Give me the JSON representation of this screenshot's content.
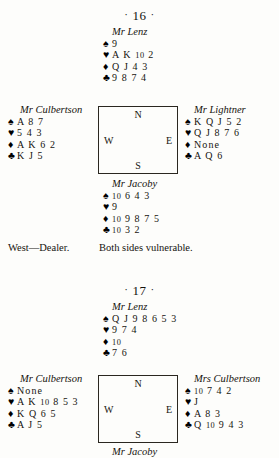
{
  "page": {
    "background": "#fdfdfb",
    "ink": "#16140f"
  },
  "suits": {
    "spade": "♠",
    "heart": "♥",
    "diamond": "♦",
    "club": "♣"
  },
  "compass": {
    "north": "N",
    "south": "S",
    "west": "W",
    "east": "E"
  },
  "deals": [
    {
      "number_label": "16",
      "dot_left": "·",
      "dot_right": "·",
      "north": {
        "player": "Mr Lenz",
        "spades": "9",
        "hearts": "A K 10 2",
        "diamonds": "Q J 4 3",
        "clubs": "9 8 7 4"
      },
      "west": {
        "player": "Mr Culbertson",
        "spades": "A 8 7",
        "hearts": "5 4 3",
        "diamonds": "A K 6 2",
        "clubs": "K J 5"
      },
      "east": {
        "player": "Mr Lightner",
        "spades": "K Q J 5 2",
        "hearts": "Q J 8 7 6",
        "diamonds": "None",
        "clubs": "A Q 6"
      },
      "south": {
        "player": "Mr Jacoby",
        "spades": "10 6 4 3",
        "hearts": "9",
        "diamonds": "10 9 8 7 5",
        "clubs": "10 3 2"
      },
      "dealer": "West—Dealer.",
      "vulnerability": "Both sides vulnerable."
    },
    {
      "number_label": "17",
      "dot_left": "·",
      "dot_right": "·",
      "north": {
        "player": "Mr Lenz",
        "spades": "Q J 9 8 6 5 3",
        "hearts": "9 7 4",
        "diamonds": "10",
        "clubs": "7 6"
      },
      "west": {
        "player": "Mr Culbertson",
        "spades": "None",
        "hearts": "A K 10 8 5 3",
        "diamonds": "K Q 6 5",
        "clubs": "A J 5"
      },
      "east": {
        "player": "Mrs Culbertson",
        "spades": "10 7 4 2",
        "hearts": "J",
        "diamonds": "A 8 3",
        "clubs": "Q 10 9 4 3"
      },
      "south": {
        "player": "Mr Jacoby"
      }
    }
  ]
}
